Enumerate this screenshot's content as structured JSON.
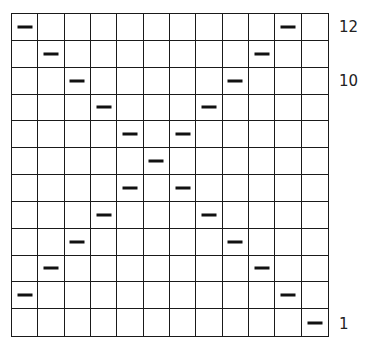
{
  "chart_data": {
    "type": "table",
    "title": "",
    "columns": 12,
    "rows": 12,
    "row_order_top_to_bottom": [
      12,
      11,
      10,
      9,
      8,
      7,
      6,
      5,
      4,
      3,
      2,
      1
    ],
    "marks": [
      {
        "row": 12,
        "cols": [
          0,
          10
        ]
      },
      {
        "row": 11,
        "cols": [
          1,
          9
        ]
      },
      {
        "row": 10,
        "cols": [
          2,
          8
        ]
      },
      {
        "row": 9,
        "cols": [
          3,
          7
        ]
      },
      {
        "row": 8,
        "cols": [
          4,
          6
        ]
      },
      {
        "row": 7,
        "cols": [
          5
        ]
      },
      {
        "row": 6,
        "cols": [
          4,
          6
        ]
      },
      {
        "row": 5,
        "cols": [
          3,
          7
        ]
      },
      {
        "row": 4,
        "cols": [
          2,
          8
        ]
      },
      {
        "row": 3,
        "cols": [
          1,
          9
        ]
      },
      {
        "row": 2,
        "cols": [
          0,
          10
        ]
      },
      {
        "row": 1,
        "cols": [
          11
        ]
      }
    ],
    "mark_symbol": "purl-dash"
  },
  "row_labels": [
    {
      "text": "12",
      "row_index": 0
    },
    {
      "text": "10",
      "row_index": 2
    },
    {
      "text": "1",
      "row_index": 11
    }
  ],
  "colors": {
    "grid": "#1a1a1a",
    "mark": "#111111",
    "background": "#ffffff"
  }
}
